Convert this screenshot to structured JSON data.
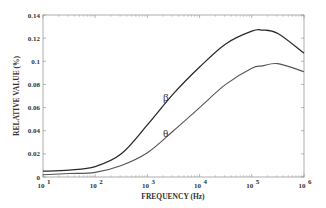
{
  "chart_data": {
    "type": "line",
    "title": "",
    "xlabel": "FREQUENCY (Hz)",
    "ylabel": "RELATIVE VALUE (%)",
    "xscale": "log",
    "xlim": [
      10,
      1000000
    ],
    "ylim": [
      0,
      0.14
    ],
    "grid": false,
    "legend": "inline labels",
    "x_ticks": [
      {
        "exp": 1,
        "label": "10",
        "sup": "1"
      },
      {
        "exp": 2,
        "label": "10",
        "sup": "2"
      },
      {
        "exp": 3,
        "label": "10",
        "sup": "3"
      },
      {
        "exp": 4,
        "label": "10",
        "sup": "4"
      },
      {
        "exp": 5,
        "label": "10",
        "sup": "5"
      },
      {
        "exp": 6,
        "label": "10",
        "sup": "6"
      }
    ],
    "y_ticks": [
      {
        "value": 0,
        "label": "0"
      },
      {
        "value": 0.02,
        "label": "0.02"
      },
      {
        "value": 0.04,
        "label": "0.04"
      },
      {
        "value": 0.06,
        "label": "0.06"
      },
      {
        "value": 0.08,
        "label": "0.08"
      },
      {
        "value": 0.1,
        "label": "0.1"
      },
      {
        "value": 0.12,
        "label": "0.12"
      },
      {
        "value": 0.14,
        "label": "0.14"
      }
    ],
    "log10_x": [
      1,
      1.5,
      2,
      2.5,
      3,
      3.5,
      4,
      4.5,
      5,
      5.2,
      5.5,
      6
    ],
    "series": [
      {
        "name": "β",
        "color": "#2a2a2a",
        "values": [
          0.005,
          0.006,
          0.009,
          0.02,
          0.045,
          0.072,
          0.095,
          0.115,
          0.126,
          0.127,
          0.124,
          0.107
        ],
        "label_pos": {
          "log10_x": 3.3,
          "value": 0.069
        }
      },
      {
        "name": "θ",
        "color": "#555555",
        "values": [
          0.002,
          0.003,
          0.004,
          0.01,
          0.021,
          0.04,
          0.06,
          0.08,
          0.094,
          0.096,
          0.098,
          0.091
        ],
        "label_pos": {
          "log10_x": 3.3,
          "value": 0.038
        }
      }
    ]
  },
  "labels": {
    "xlabel": "FREQUENCY (Hz)",
    "ylabel": "RELATIVE VALUE (%)",
    "beta": "β",
    "theta": "θ"
  }
}
